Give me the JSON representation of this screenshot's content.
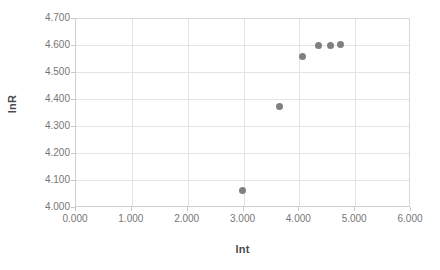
{
  "chart_data": {
    "type": "scatter",
    "title": "",
    "xlabel": "lnt",
    "ylabel": "lnR",
    "xlim": [
      0.0,
      6.0
    ],
    "ylim": [
      4.0,
      4.7
    ],
    "xticks": [
      "0.000",
      "1.000",
      "2.000",
      "3.000",
      "4.000",
      "5.000",
      "6.000"
    ],
    "xtick_values": [
      0.0,
      1.0,
      2.0,
      3.0,
      4.0,
      5.0,
      6.0
    ],
    "yticks": [
      "4.000",
      "4.100",
      "4.200",
      "4.300",
      "4.400",
      "4.500",
      "4.600",
      "4.700"
    ],
    "ytick_values": [
      4.0,
      4.1,
      4.2,
      4.3,
      4.4,
      4.5,
      4.6,
      4.7
    ],
    "grid": true,
    "legend": false,
    "legend_position": "none",
    "marker_color": "#808080",
    "marker_shape": "circle",
    "series": [
      {
        "name": "lnR",
        "x": [
          2.99,
          3.64,
          4.05,
          4.35,
          4.55,
          4.73
        ],
        "y": [
          4.062,
          4.372,
          4.556,
          4.598,
          4.6,
          4.601
        ]
      }
    ],
    "points": [
      {
        "x": 2.99,
        "y": 4.062
      },
      {
        "x": 3.64,
        "y": 4.372
      },
      {
        "x": 4.05,
        "y": 4.556
      },
      {
        "x": 4.35,
        "y": 4.598
      },
      {
        "x": 4.55,
        "y": 4.6
      },
      {
        "x": 4.73,
        "y": 4.601
      }
    ],
    "colors": {
      "marker": "#808080",
      "gridline": "#e3e3e3",
      "axis": "#d0d0d0",
      "tick_text": "#767676",
      "axis_title": "#4a4a4a",
      "background": "#ffffff"
    }
  }
}
